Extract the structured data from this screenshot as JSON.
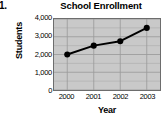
{
  "question_number": "1.",
  "chart_data": {
    "type": "line",
    "title": "School Enrollment",
    "xlabel": "Year",
    "ylabel": "Students",
    "categories": [
      "2000",
      "2001",
      "2002",
      "2003"
    ],
    "values": [
      2000,
      2500,
      2750,
      3500
    ],
    "x_tick_labels": [
      "2000",
      "2001",
      "2002",
      "2003"
    ],
    "y_tick_labels": [
      "4,000",
      "3,000",
      "2,000",
      "1,000",
      "0"
    ],
    "y_tick_values": [
      4000,
      3000,
      2000,
      1000,
      0
    ],
    "ylim": [
      0,
      4000
    ],
    "grid": true,
    "grid_step": 500,
    "legend": "none",
    "series": [
      {
        "name": "Students",
        "values": [
          2000,
          2500,
          2750,
          3500
        ],
        "marker": "filled-circle",
        "color": "#000000"
      }
    ],
    "colors": {
      "line": "#000000",
      "marker": "#000000",
      "plot_background": "#c9c9c9",
      "gridline": "#9a9a9a",
      "axis_border": "#6d6d6d",
      "text": "#000000"
    }
  }
}
